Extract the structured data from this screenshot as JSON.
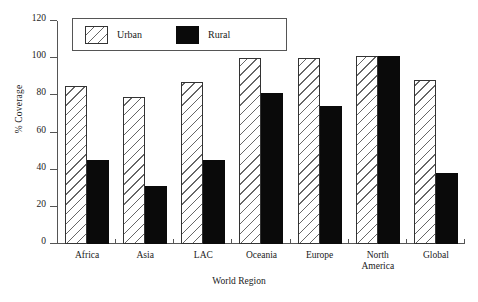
{
  "chart_data": {
    "type": "bar",
    "title": "",
    "subtitle": "",
    "xlabel": "World Region",
    "ylabel": "% Coverage",
    "ylim": [
      0,
      120
    ],
    "yticks": [
      0,
      20,
      40,
      60,
      80,
      100,
      120
    ],
    "grid": false,
    "legend_position": "top-left-inside",
    "categories": [
      "Africa",
      "Asia",
      "LAC",
      "Oceania",
      "Europe",
      "North America",
      "Global"
    ],
    "series": [
      {
        "name": "Urban",
        "style": "diagonal-hatch",
        "color": "#ffffff",
        "values": [
          85,
          79,
          87,
          100,
          100,
          101,
          88
        ]
      },
      {
        "name": "Rural",
        "style": "solid",
        "color": "#0a0a0a",
        "values": [
          45,
          31,
          45,
          81,
          74,
          101,
          38
        ]
      }
    ]
  },
  "axes": {
    "y_title": "% Coverage",
    "x_title": "World Region",
    "y_tick_labels": [
      "0",
      "20",
      "40",
      "60",
      "80",
      "100",
      "120"
    ],
    "x_tick_labels": [
      [
        "Africa"
      ],
      [
        "Asia"
      ],
      [
        "LAC"
      ],
      [
        "Oceania"
      ],
      [
        "Europe"
      ],
      [
        "North",
        "America"
      ],
      [
        "Global"
      ]
    ]
  },
  "legend": {
    "items": [
      {
        "label": "Urban",
        "swatch": "hatch-swatch"
      },
      {
        "label": "Rural",
        "swatch": "solid-black-swatch"
      }
    ]
  }
}
